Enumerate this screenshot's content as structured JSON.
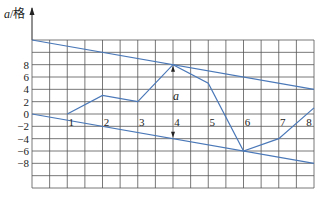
{
  "chart_data": {
    "type": "line",
    "title": "",
    "ylabel": "a/格",
    "ylabel_var": "a",
    "ylabel_unit": "/格",
    "xlabel": "",
    "x": [
      1,
      2,
      3,
      4,
      5,
      6,
      7,
      8
    ],
    "series": [
      {
        "name": "a",
        "values": [
          0,
          3,
          2,
          8,
          5,
          -6,
          -4,
          1
        ],
        "color": "#4a78b8"
      }
    ],
    "envelope_lines": [
      {
        "name": "upper-boundary",
        "from": [
          0,
          12
        ],
        "to": [
          8,
          4
        ],
        "color": "#4a78b8"
      },
      {
        "name": "lower-boundary",
        "from": [
          0,
          0
        ],
        "to": [
          8,
          -8
        ],
        "color": "#4a78b8"
      }
    ],
    "annotation": {
      "text": "a",
      "x": 4,
      "arrow_from": 8,
      "arrow_to": -4
    },
    "x_tick_labels": [
      "1",
      "2",
      "3",
      "4",
      "5",
      "6",
      "7",
      "8"
    ],
    "y_tick_labels": [
      "8",
      "6",
      "4",
      "2",
      "0",
      "-2",
      "-4",
      "-6",
      "-8"
    ],
    "ylim": [
      -14,
      14
    ],
    "xlim": [
      0,
      8
    ],
    "grid": true,
    "legend": "none"
  },
  "colors": {
    "line": "#4a78b8",
    "grid": "#555555",
    "text": "#222222"
  }
}
